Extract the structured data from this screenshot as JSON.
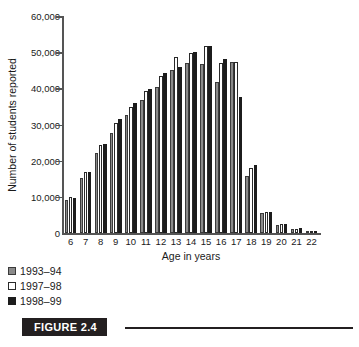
{
  "figure": {
    "caption_label": "FIGURE 2.4"
  },
  "chart_data": {
    "type": "bar",
    "title": "",
    "xlabel": "Age in years",
    "ylabel": "Number of students reported",
    "categories": [
      "6",
      "7",
      "8",
      "9",
      "10",
      "11",
      "12",
      "13",
      "14",
      "15",
      "16",
      "17",
      "18",
      "19",
      "20",
      "21",
      "22"
    ],
    "ytick_labels": [
      "60,000",
      "50,000",
      "40,000",
      "30,000",
      "20,000",
      "10,000",
      "0"
    ],
    "ytick_values": [
      60000,
      50000,
      40000,
      30000,
      20000,
      10000,
      0
    ],
    "ylim": [
      0,
      60000
    ],
    "grid": false,
    "legend_position": "below-left",
    "series": [
      {
        "name": "1993–94",
        "color": "#8a8a8a",
        "values": [
          9000,
          15300,
          22200,
          27700,
          32600,
          36800,
          40500,
          45100,
          47000,
          46700,
          41800,
          47400,
          15800,
          5600,
          2200,
          1100,
          400
        ]
      },
      {
        "name": "1997–98",
        "color": "#ffffff",
        "values": [
          9900,
          17000,
          24400,
          30400,
          34900,
          39400,
          43500,
          48700,
          49800,
          51800,
          47100,
          47400,
          18100,
          5900,
          2400,
          1200,
          450
        ]
      },
      {
        "name": "1998–99",
        "color": "#1c1c1c",
        "values": [
          9700,
          16900,
          24700,
          31500,
          36000,
          39700,
          44300,
          46000,
          50000,
          51600,
          48000,
          37600,
          18900,
          5900,
          2500,
          1300,
          500
        ]
      }
    ]
  }
}
